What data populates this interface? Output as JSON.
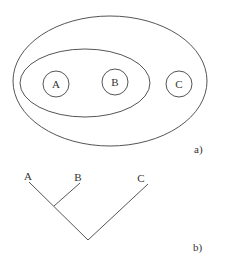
{
  "panel_a": {
    "label": "a)",
    "outer_ellipse": {
      "cx": 110,
      "cy": 81,
      "rx": 97,
      "ry": 65
    },
    "inner_ellipse": {
      "cx": 85,
      "cy": 83,
      "rx": 65,
      "ry": 34
    },
    "circles": [
      {
        "name": "A",
        "label": "A",
        "cx": 56,
        "cy": 84,
        "r": 13
      },
      {
        "name": "B",
        "label": "B",
        "cx": 115,
        "cy": 82,
        "r": 13
      },
      {
        "name": "C",
        "label": "C",
        "cx": 179,
        "cy": 84,
        "r": 13
      }
    ]
  },
  "panel_b": {
    "label": "b)",
    "leaves": [
      {
        "label": "A",
        "x": 28,
        "y": 180
      },
      {
        "label": "B",
        "x": 78,
        "y": 181
      },
      {
        "label": "C",
        "x": 141,
        "y": 182
      }
    ]
  },
  "colors": {
    "stroke": "#555555",
    "text": "#333333",
    "background": "#ffffff"
  }
}
